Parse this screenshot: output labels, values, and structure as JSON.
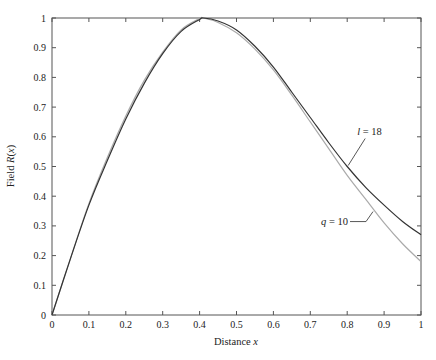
{
  "chart_data": {
    "type": "line",
    "title": "",
    "xlabel": "Distance x",
    "ylabel": "Field R(x)",
    "xlim": [
      0,
      1
    ],
    "ylim": [
      0,
      1
    ],
    "grid": false,
    "xticks": [
      "0",
      "0.1",
      "0.2",
      "0.3",
      "0.4",
      "0.5",
      "0.6",
      "0.7",
      "0.8",
      "0.9",
      "1"
    ],
    "yticks": [
      "0",
      "0.1",
      "0.2",
      "0.3",
      "0.4",
      "0.5",
      "0.6",
      "0.7",
      "0.8",
      "0.9",
      "1"
    ],
    "x": [
      0,
      0.05,
      0.1,
      0.15,
      0.2,
      0.25,
      0.3,
      0.35,
      0.4,
      0.41,
      0.45,
      0.5,
      0.55,
      0.6,
      0.65,
      0.7,
      0.75,
      0.8,
      0.85,
      0.9,
      0.95,
      1.0
    ],
    "series": [
      {
        "name": "l = 18",
        "color": "#333333",
        "values": [
          0,
          0.19,
          0.37,
          0.52,
          0.66,
          0.78,
          0.88,
          0.955,
          0.995,
          1.0,
          0.99,
          0.96,
          0.905,
          0.835,
          0.75,
          0.665,
          0.58,
          0.5,
          0.43,
          0.37,
          0.315,
          0.27
        ]
      },
      {
        "name": "q = 10",
        "color": "#aaaaaa",
        "values": [
          0,
          0.19,
          0.375,
          0.53,
          0.67,
          0.79,
          0.885,
          0.96,
          0.998,
          1.0,
          0.985,
          0.95,
          0.895,
          0.825,
          0.74,
          0.65,
          0.56,
          0.47,
          0.39,
          0.31,
          0.24,
          0.18
        ]
      }
    ],
    "annotations": [
      {
        "text_prefix": "l",
        "text_suffix": " = 18",
        "series": "l = 18",
        "at_x": 0.8
      },
      {
        "text_prefix": "q",
        "text_suffix": " = 10",
        "series": "q = 10",
        "at_x": 0.87
      }
    ]
  }
}
